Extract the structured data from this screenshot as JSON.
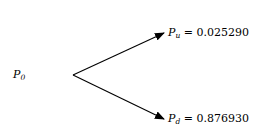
{
  "diagram": {
    "type": "binomial-tree-one-step",
    "root": {
      "symbol": "P",
      "subscript": "0"
    },
    "branches": [
      {
        "name": "up",
        "symbol": "P",
        "subscript": "u",
        "equals": "=",
        "value": "0.025290"
      },
      {
        "name": "down",
        "symbol": "P",
        "subscript": "d",
        "equals": "=",
        "value": "0.876930"
      }
    ],
    "colors": {
      "line": "#000000",
      "text": "#000000",
      "background": "#ffffff"
    }
  }
}
